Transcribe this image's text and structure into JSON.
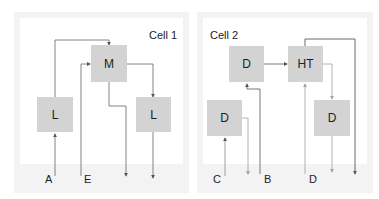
{
  "cells": [
    {
      "title": "Cell 1",
      "nodes": [
        {
          "id": "M",
          "label": "M"
        },
        {
          "id": "L1",
          "label": "L"
        },
        {
          "id": "L2",
          "label": "L"
        }
      ],
      "inputs": [
        {
          "id": "A",
          "label": "A"
        },
        {
          "id": "E",
          "label": "E"
        }
      ],
      "outputs": 2
    },
    {
      "title": "Cell 2",
      "nodes": [
        {
          "id": "D_top",
          "label": "D"
        },
        {
          "id": "HT",
          "label": "HT"
        },
        {
          "id": "D_left",
          "label": "D"
        },
        {
          "id": "D_right",
          "label": "D"
        }
      ],
      "inputs": [
        {
          "id": "C",
          "label": "C"
        },
        {
          "id": "B",
          "label": "B"
        },
        {
          "id": "D",
          "label": "D"
        }
      ],
      "outputs": 3
    }
  ],
  "colors": {
    "node_fill": "#d3d3d3",
    "panel_bg": "#f3f3f3",
    "wire_dark": "#555555",
    "wire_light": "#a8a8a8"
  }
}
